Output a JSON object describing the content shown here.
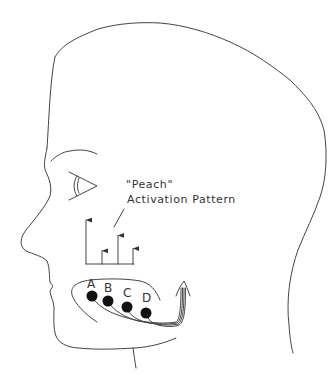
{
  "figure": {
    "caption_line1": "\"Peach\"",
    "caption_line2": "Activation Pattern",
    "ink_color": "#444444"
  },
  "electrodes": [
    {
      "label": "A",
      "activation": 1.0
    },
    {
      "label": "B",
      "activation": 0.3
    },
    {
      "label": "C",
      "activation": 0.65
    },
    {
      "label": "D",
      "activation": 0.35
    }
  ]
}
